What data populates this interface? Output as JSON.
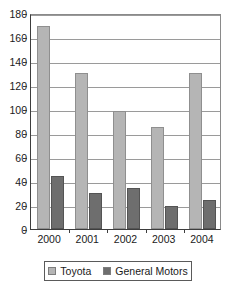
{
  "chart_data": {
    "type": "bar",
    "title": "",
    "subtitle": "",
    "xlabel": "",
    "ylabel": "",
    "categories": [
      "2000",
      "2001",
      "2002",
      "2003",
      "2004"
    ],
    "series": [
      {
        "name": "Toyota",
        "color": "#b5b5b5",
        "values": [
          169,
          130,
          98,
          85,
          130
        ]
      },
      {
        "name": "General Motors",
        "color": "#6e6e6e",
        "values": [
          44,
          30,
          34,
          19,
          24
        ]
      }
    ],
    "ylim": [
      0,
      180
    ],
    "ytick_step": 20,
    "yticks": [
      0,
      20,
      40,
      60,
      80,
      100,
      120,
      140,
      160,
      180
    ],
    "ytick_labels": [
      "0",
      "20",
      "40",
      "60",
      "80",
      "100",
      "120",
      "140",
      "160",
      "180"
    ],
    "grid": true,
    "grid_axis": "y",
    "legend_position": "bottom",
    "annotations": []
  },
  "legend": {
    "items": [
      {
        "label": "Toyota",
        "swatch": "toyota-swatch"
      },
      {
        "label": "General Motors",
        "swatch": "general-motors-swatch"
      }
    ]
  },
  "colors": {
    "toyota": "#b5b5b5",
    "general_motors": "#6e6e6e",
    "axis": "#3d3d3d",
    "gridline": "#9a9a9a",
    "text": "#1a1a1a",
    "background": "#ffffff"
  }
}
